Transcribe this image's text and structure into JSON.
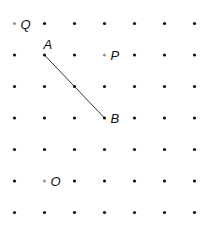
{
  "diagram": {
    "type": "dot-grid",
    "grid": {
      "columns": 7,
      "rows": 7,
      "origin_x": 14.5,
      "origin_y": 23.5,
      "spacing_x": 30,
      "spacing_y": 31.5,
      "dot_color": "#111111",
      "highlight_color": "#999999"
    },
    "points": [
      {
        "label": "Q",
        "col": 0,
        "row": 0,
        "highlight": true
      },
      {
        "label": "A",
        "col": 1,
        "row": 1,
        "highlight": false,
        "label_pos": "above"
      },
      {
        "label": "P",
        "col": 3,
        "row": 1,
        "highlight": true
      },
      {
        "label": "B",
        "col": 3,
        "row": 3,
        "highlight": false
      },
      {
        "label": "O",
        "col": 1,
        "row": 5,
        "highlight": true
      }
    ],
    "segments": [
      {
        "from": "A",
        "to": "B",
        "color": "#333333"
      }
    ]
  }
}
